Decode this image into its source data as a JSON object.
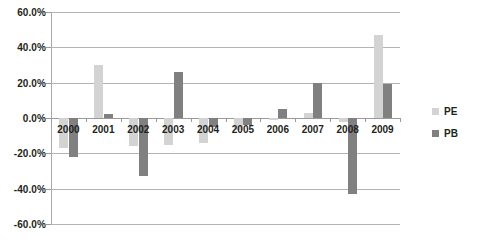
{
  "chart_data": {
    "type": "bar",
    "title": "",
    "xlabel": "",
    "ylabel": "",
    "ylim": [
      -60,
      60
    ],
    "ytick_labels": [
      "60.0%",
      "40.0%",
      "20.0%",
      "0.0%",
      "-20.0%",
      "-40.0%",
      "-60.0%"
    ],
    "yticks": [
      60,
      40,
      20,
      0,
      -20,
      -40,
      -60
    ],
    "grid": true,
    "legend_position": "right",
    "categories": [
      "2000",
      "2001",
      "2002",
      "2003",
      "2004",
      "2005",
      "2006",
      "2007",
      "2008",
      "2009"
    ],
    "series": [
      {
        "name": "PE",
        "color": "#d3d3d3",
        "values": [
          -17,
          30,
          -16,
          -15,
          -14,
          -7,
          -1,
          3,
          -2,
          47
        ]
      },
      {
        "name": "PB",
        "color": "#808080",
        "values": [
          -22,
          2,
          -33,
          26,
          -5,
          -4,
          5,
          20,
          -43,
          19
        ]
      }
    ]
  },
  "legend": {
    "items": [
      {
        "label": "PE",
        "swatch": "pe-swatch"
      },
      {
        "label": "PB",
        "swatch": "pb-swatch"
      }
    ]
  }
}
